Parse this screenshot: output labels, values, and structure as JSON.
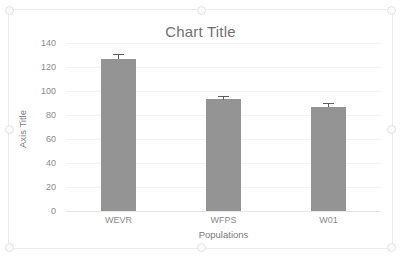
{
  "chart_data": {
    "type": "bar",
    "title": "Chart Title",
    "xlabel": "Populations",
    "ylabel": "Axis Title",
    "categories": [
      "WEVR",
      "WFPS",
      "W01"
    ],
    "values": [
      127,
      93,
      87
    ],
    "errors": [
      4,
      3,
      3
    ],
    "ylim": [
      0,
      140
    ],
    "yticks": [
      0,
      20,
      40,
      60,
      80,
      100,
      120,
      140
    ],
    "ytick_labels": [
      "0",
      "20",
      "40",
      "60",
      "80",
      "100",
      "120",
      "140"
    ],
    "grid": true,
    "legend": false,
    "bar_color": "#949494",
    "error_bar_color": "#5e5e5e",
    "gridline_color": "#f2f2f2",
    "text_color": "#7b7b7b",
    "tick_color": "#8a8a8a",
    "plot_background": "#ffffff"
  },
  "chart_object": {
    "border_color": "#ececed",
    "selected": true,
    "handles": [
      "top-left",
      "top-middle",
      "top-right",
      "middle-left",
      "middle-right",
      "bottom-left",
      "bottom-middle",
      "bottom-right"
    ]
  }
}
